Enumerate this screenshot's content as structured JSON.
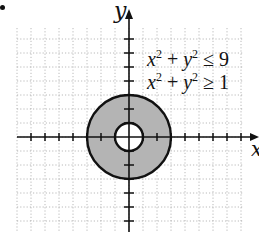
{
  "figure": {
    "axis_labels": {
      "x": "x",
      "y": "y"
    },
    "inequalities": [
      {
        "lhs_a": "x",
        "lhs_b": "y",
        "exp": "2",
        "op": "≤",
        "rhs": "9"
      },
      {
        "lhs_a": "x",
        "lhs_b": "y",
        "exp": "2",
        "op": "≥",
        "rhs": "1"
      }
    ],
    "colors": {
      "shade": "#b4b4b4",
      "axis": "#111111",
      "grid": "#a8a8a8"
    }
  },
  "chart_data": {
    "type": "region",
    "title": "",
    "xlabel": "x",
    "ylabel": "y",
    "region": "annulus 1 <= x^2 + y^2 <= 9",
    "inner_radius": 1,
    "outer_radius": 3,
    "center": [
      0,
      0
    ],
    "xlim": [
      -8,
      8
    ],
    "ylim": [
      -7,
      8
    ],
    "grid": true,
    "ticks_every": 1,
    "annotations": [
      "x^2 + y^2 ≤ 9",
      "x^2 + y^2 ≥ 1"
    ]
  }
}
